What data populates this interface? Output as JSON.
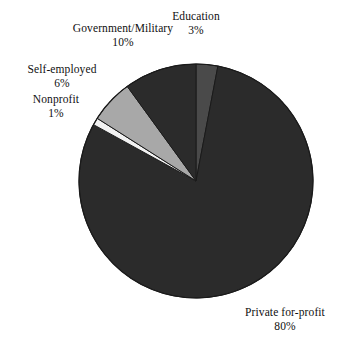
{
  "chart_data": {
    "type": "pie",
    "title": "",
    "categories": [
      "Education",
      "Private for-profit",
      "Nonprofit",
      "Self-employed",
      "Government/Military"
    ],
    "values": [
      3,
      80,
      1,
      6,
      10
    ],
    "value_unit": "%",
    "total": 100,
    "start_angle_deg": 0,
    "direction": "clockwise",
    "legend": "none",
    "labels_position": "outside",
    "slices": [
      {
        "name": "Education",
        "value": 3,
        "label": "Education",
        "percent_label": "3%",
        "color": "#4a4a4a",
        "start_angle_deg": 0,
        "end_angle_deg": 10.8
      },
      {
        "name": "Private for-profit",
        "value": 80,
        "label": "Private for-profit",
        "percent_label": "80%",
        "color": "#2b2b2b",
        "start_angle_deg": 10.8,
        "end_angle_deg": 298.8
      },
      {
        "name": "Nonprofit",
        "value": 1,
        "label": "Nonprofit",
        "percent_label": "1%",
        "color": "#f2f2f2",
        "start_angle_deg": 298.8,
        "end_angle_deg": 302.4
      },
      {
        "name": "Self-employed",
        "value": 6,
        "label": "Self-employed",
        "percent_label": "6%",
        "color": "#a8a8a8",
        "start_angle_deg": 302.4,
        "end_angle_deg": 324.0
      },
      {
        "name": "Government/Military",
        "value": 10,
        "label": "Government/Military",
        "percent_label": "10%",
        "color": "#2b2b2b",
        "start_angle_deg": 324.0,
        "end_angle_deg": 360.0
      }
    ],
    "geometry": {
      "center_x": 196,
      "center_y": 181,
      "radius": 117
    },
    "colors": {
      "background": "#ffffff",
      "outline": "#1a1a1a",
      "text": "#101010",
      "dark_slice": "#2b2b2b",
      "medium_slice": "#4a4a4a",
      "light_slice": "#a8a8a8",
      "white_slice": "#f2f2f2"
    }
  }
}
